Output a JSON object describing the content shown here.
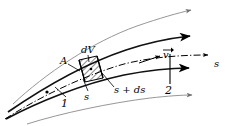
{
  "figure": {
    "labels": {
      "area": "A",
      "control_volume": "dV",
      "position_s": "s",
      "position_s_plus_ds": "s + ds",
      "velocity": "v",
      "axis_s": "s",
      "station_1": "1",
      "station_2": "2"
    },
    "colors": {
      "line_bold": "#000000",
      "line_thin": "#8a8a8a",
      "hatch": "#000000",
      "background": "#ffffff"
    },
    "elements": {
      "streamlines_bold": 2,
      "streamlines_thin": 2,
      "centerline_style": "dash-dot",
      "control_volume_fill": "diagonal-hatch"
    }
  }
}
